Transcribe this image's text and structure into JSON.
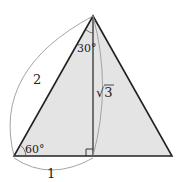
{
  "diagram": {
    "type": "triangle-diagram",
    "fill_color": "#e4e4e4",
    "stroke_color": "#222222",
    "arc_color": "#9a9a9a",
    "labels": {
      "hypotenuse": "2",
      "base": "1",
      "altitude": "√3",
      "top_angle": "30°",
      "bottom_angle": "60°"
    },
    "right_angle_marker": true
  }
}
